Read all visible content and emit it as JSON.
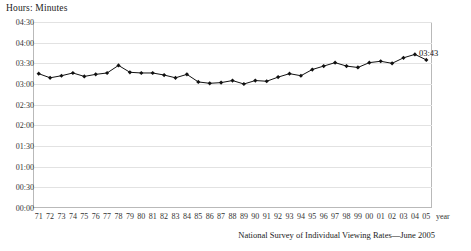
{
  "chart_data": {
    "type": "line",
    "title": "",
    "ylabel": "Hours: Minutes",
    "xlabel": "year",
    "grid": true,
    "legend": false,
    "ylim": [
      0,
      270
    ],
    "ytick_labels": [
      "00:00",
      "00:30",
      "01:00",
      "01:30",
      "02:00",
      "02:30",
      "03:00",
      "03:30",
      "04:00",
      "04:30"
    ],
    "ytick_values": [
      0,
      30,
      60,
      90,
      120,
      150,
      180,
      210,
      240,
      270
    ],
    "categories": [
      "71",
      "72",
      "73",
      "74",
      "75",
      "76",
      "77",
      "78",
      "79",
      "80",
      "81",
      "82",
      "83",
      "84",
      "85",
      "86",
      "87",
      "88",
      "89",
      "90",
      "91",
      "92",
      "93",
      "94",
      "95",
      "96",
      "97",
      "98",
      "99",
      "00",
      "01",
      "02",
      "03",
      "04",
      "05"
    ],
    "values_hm": [
      "03:15",
      "03:09",
      "03:12",
      "03:16",
      "03:11",
      "03:14",
      "03:16",
      "03:27",
      "03:17",
      "03:16",
      "03:16",
      "03:13",
      "03:09",
      "03:14",
      "03:03",
      "03:01",
      "03:02",
      "03:05",
      "03:00",
      "03:05",
      "03:04",
      "03:10",
      "03:15",
      "03:12",
      "03:21",
      "03:26",
      "03:31",
      "03:26",
      "03:24",
      "03:31",
      "03:33",
      "03:30",
      "03:38",
      "03:43",
      "03:35"
    ],
    "values": [
      195,
      189,
      192,
      196,
      191,
      194,
      196,
      207,
      197,
      196,
      196,
      193,
      189,
      194,
      183,
      181,
      182,
      185,
      180,
      185,
      184,
      190,
      195,
      192,
      201,
      206,
      211,
      206,
      204,
      211,
      213,
      210,
      218,
      223,
      215
    ],
    "annotations": [
      {
        "label": "03:43",
        "category": "04",
        "value": 223
      }
    ]
  },
  "footnote": "National Survey of Individual Viewing Rates—June 2005",
  "axis": {
    "y_title": "Hours: Minutes",
    "x_unit": "year"
  }
}
